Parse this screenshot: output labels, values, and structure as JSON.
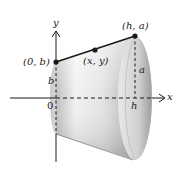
{
  "figure": {
    "axes": {
      "x_label": "x",
      "y_label": "y",
      "origin_label": "0"
    },
    "points": [
      {
        "label": "(0, b)"
      },
      {
        "label": "(x, y)"
      },
      {
        "label": "(h, a)"
      }
    ],
    "segment_labels": {
      "left_radius": "b",
      "right_radius": "a",
      "height": "h"
    },
    "colors": {
      "line": "#1a1a1a",
      "shade_dark": "#9a9a9a",
      "shade_light": "#f4f4f4",
      "background": "#ffffff"
    }
  }
}
